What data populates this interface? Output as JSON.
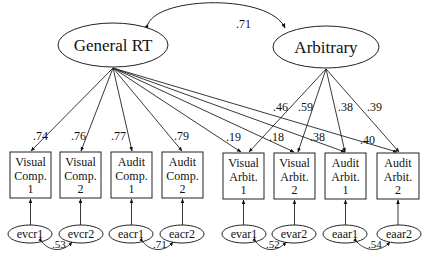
{
  "diagram": {
    "type": "structural-equation-model",
    "latent_factors": [
      {
        "id": "general",
        "label": "General RT"
      },
      {
        "id": "arbitrary",
        "label": "Arbitrary"
      }
    ],
    "factor_correlation": ".71",
    "observed": [
      {
        "id": "vc1",
        "line1": "Visual",
        "line2": "Comp.",
        "line3": "1",
        "general_loading": ".74"
      },
      {
        "id": "vc2",
        "line1": "Visual",
        "line2": "Comp.",
        "line3": "2",
        "general_loading": ".76"
      },
      {
        "id": "ac1",
        "line1": "Audit",
        "line2": "Comp.",
        "line3": "1",
        "general_loading": ".77"
      },
      {
        "id": "ac2",
        "line1": "Audit",
        "line2": "Comp.",
        "line3": "2",
        "general_loading": ".79"
      },
      {
        "id": "va1",
        "line1": "Visual",
        "line2": "Arbit.",
        "line3": "1",
        "general_loading": ".19",
        "arbitrary_loading": ".46"
      },
      {
        "id": "va2",
        "line1": "Visual",
        "line2": "Arbit.",
        "line3": "2",
        "general_loading": ".18",
        "arbitrary_loading": ".59"
      },
      {
        "id": "aa1",
        "line1": "Audit",
        "line2": "Arbit.",
        "line3": "1",
        "general_loading": ".38",
        "arbitrary_loading": ".38"
      },
      {
        "id": "aa2",
        "line1": "Audit",
        "line2": "Arbit.",
        "line3": "2",
        "general_loading": ".40",
        "arbitrary_loading": ".39"
      }
    ],
    "errors": [
      "evcr1",
      "evcr2",
      "eacr1",
      "eacr2",
      "evar1",
      "evar2",
      "eaar1",
      "eaar2"
    ],
    "error_correlations": [
      {
        "between": [
          "evcr1",
          "evcr2"
        ],
        "value": ".53"
      },
      {
        "between": [
          "eacr1",
          "eacr2"
        ],
        "value": ".71"
      },
      {
        "between": [
          "evar1",
          "evar2"
        ],
        "value": ".52"
      },
      {
        "between": [
          "eaar1",
          "eaar2"
        ],
        "value": ".54"
      }
    ]
  }
}
